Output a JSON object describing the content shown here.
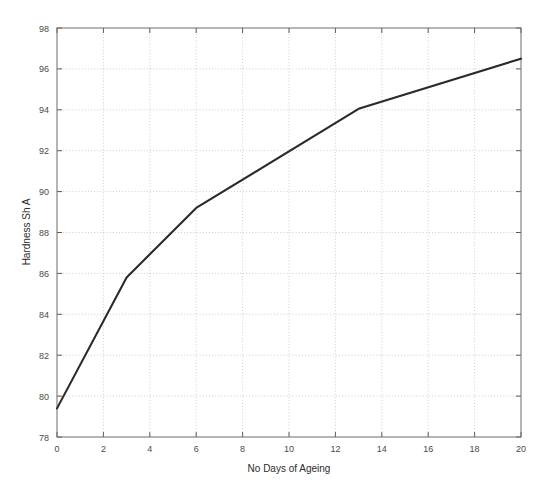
{
  "chart_data": {
    "type": "line",
    "title": "",
    "xlabel": "No Days of Ageing",
    "ylabel": "Hardness Sh A",
    "xlim": [
      0,
      20
    ],
    "ylim": [
      78,
      98
    ],
    "xticks": [
      0,
      2,
      4,
      6,
      8,
      10,
      12,
      14,
      16,
      18,
      20
    ],
    "yticks": [
      78,
      80,
      82,
      84,
      86,
      88,
      90,
      92,
      94,
      96,
      98
    ],
    "xtick_labels": [
      "0",
      "2",
      "4",
      "6",
      "8",
      "10",
      "12",
      "14",
      "16",
      "18",
      "20"
    ],
    "ytick_labels": [
      "78",
      "80",
      "82",
      "84",
      "86",
      "88",
      "90",
      "92",
      "94",
      "96",
      "98"
    ],
    "grid": true,
    "grid_style": "dotted",
    "legend": null,
    "legend_position": "none",
    "line_color": "#2a2a2a",
    "grid_color": "#b9b9b9",
    "axis_color": "#6d6d6d",
    "background_color": "#ffffff",
    "series": [
      {
        "name": "Hardness",
        "x": [
          0,
          3,
          6,
          13,
          20
        ],
        "values": [
          79.4,
          85.8,
          89.2,
          94.05,
          96.5
        ]
      }
    ]
  },
  "axis_labels": {
    "x_title": "No Days of Ageing",
    "y_title": "Hardness Sh A"
  }
}
